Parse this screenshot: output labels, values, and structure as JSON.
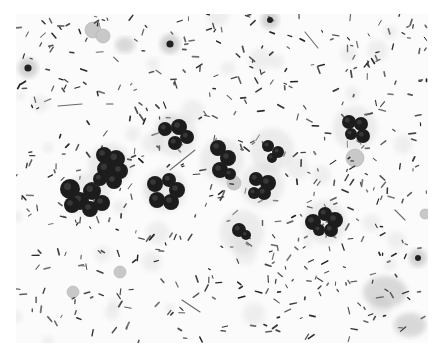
{
  "image": {
    "description": "Grayscale micrograph of a stained smear showing numerous rod-shaped bacteria and clusters of dark lobulated neutrophils",
    "width": 444,
    "height": 357,
    "border_color": "#ffffff",
    "field_color": "#fbfbfb",
    "rod_color": "#3a3a3a",
    "cell_color": "#1e1e1e",
    "pale_cell_color": "#c8c8c8",
    "rod_count": 520,
    "seed": 7
  },
  "clusters": [
    {
      "cx": 88,
      "cy": 195,
      "lobes": [
        [
          -18,
          -6,
          10
        ],
        [
          -8,
          6,
          9
        ],
        [
          4,
          -4,
          9
        ],
        [
          14,
          8,
          8
        ],
        [
          2,
          14,
          8
        ],
        [
          -16,
          10,
          8
        ]
      ]
    },
    {
      "cx": 110,
      "cy": 165,
      "lobes": [
        [
          -6,
          -10,
          8
        ],
        [
          6,
          -6,
          9
        ],
        [
          10,
          6,
          8
        ],
        [
          -4,
          4,
          9
        ],
        [
          -10,
          14,
          7
        ],
        [
          4,
          16,
          8
        ]
      ]
    },
    {
      "cx": 175,
      "cy": 135,
      "lobes": [
        [
          -10,
          -6,
          7
        ],
        [
          4,
          -8,
          8
        ],
        [
          12,
          2,
          7
        ],
        [
          0,
          8,
          7
        ]
      ]
    },
    {
      "cx": 165,
      "cy": 190,
      "lobes": [
        [
          -10,
          -6,
          8
        ],
        [
          4,
          -10,
          7
        ],
        [
          12,
          0,
          8
        ],
        [
          6,
          12,
          8
        ],
        [
          -8,
          10,
          8
        ]
      ]
    },
    {
      "cx": 222,
      "cy": 160,
      "lobes": [
        [
          -4,
          -12,
          8
        ],
        [
          6,
          -2,
          8
        ],
        [
          -2,
          10,
          8
        ],
        [
          8,
          14,
          6
        ]
      ]
    },
    {
      "cx": 262,
      "cy": 185,
      "lobes": [
        [
          -6,
          -6,
          7
        ],
        [
          6,
          -2,
          8
        ],
        [
          2,
          8,
          7
        ],
        [
          -8,
          8,
          6
        ]
      ]
    },
    {
      "cx": 272,
      "cy": 150,
      "lobes": [
        [
          -4,
          -4,
          6
        ],
        [
          6,
          2,
          6
        ],
        [
          0,
          8,
          5
        ]
      ]
    },
    {
      "cx": 325,
      "cy": 222,
      "lobes": [
        [
          -12,
          0,
          8
        ],
        [
          0,
          -8,
          7
        ],
        [
          10,
          -2,
          8
        ],
        [
          6,
          8,
          7
        ],
        [
          -6,
          8,
          6
        ]
      ]
    },
    {
      "cx": 355,
      "cy": 128,
      "lobes": [
        [
          -6,
          -6,
          7
        ],
        [
          6,
          -4,
          7
        ],
        [
          8,
          8,
          7
        ],
        [
          -4,
          6,
          6
        ]
      ]
    },
    {
      "cx": 242,
      "cy": 232,
      "lobes": [
        [
          -3,
          -2,
          7
        ],
        [
          4,
          3,
          5
        ]
      ]
    }
  ],
  "pale_cells": [
    {
      "cx": 93,
      "cy": 30,
      "r": 8
    },
    {
      "cx": 103,
      "cy": 36,
      "r": 7
    },
    {
      "cx": 234,
      "cy": 183,
      "r": 7
    },
    {
      "cx": 355,
      "cy": 158,
      "r": 9
    },
    {
      "cx": 73,
      "cy": 292,
      "r": 6
    },
    {
      "cx": 120,
      "cy": 272,
      "r": 6
    },
    {
      "cx": 425,
      "cy": 214,
      "r": 5
    }
  ],
  "dark_spots": [
    {
      "cx": 28,
      "cy": 68,
      "r": 6
    },
    {
      "cx": 170,
      "cy": 44,
      "r": 6
    },
    {
      "cx": 418,
      "cy": 258,
      "r": 5
    },
    {
      "cx": 270,
      "cy": 20,
      "r": 5
    }
  ],
  "debris_patches": [
    {
      "cx": 385,
      "cy": 292,
      "rx": 22,
      "ry": 16
    },
    {
      "cx": 410,
      "cy": 325,
      "rx": 16,
      "ry": 12
    },
    {
      "cx": 125,
      "cy": 45,
      "rx": 10,
      "ry": 8
    }
  ]
}
